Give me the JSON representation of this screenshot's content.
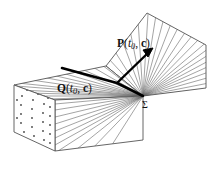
{
  "figure": {
    "type": "geometric-diagram",
    "background_color": "#ffffff",
    "line_color": "#555555",
    "bold_line_color": "#000000",
    "text_color": "#111111",
    "width": 219,
    "height": 173
  },
  "labels": {
    "vector_p": {
      "name": "P",
      "arg_time": "t",
      "arg_time_sub": "0",
      "comma": ", ",
      "arg_vec": "c",
      "open": "(",
      "close": ")",
      "full": "P(t0, c)"
    },
    "vector_q": {
      "name": "Q",
      "arg_time": "t",
      "arg_time_sub": "0",
      "comma": ", ",
      "arg_vec": "c",
      "open": "(",
      "close": ")",
      "full": "Q(t0, c)"
    },
    "surface_sigma": {
      "symbol": "Σ",
      "full": "Σ"
    }
  },
  "geometry": {
    "prism": {
      "left_face_corners": "14,85 14,132 55,151 55,100",
      "top_face_corners": "14,85 55,100 143,96 106,66",
      "front_face_corners": "55,100 55,151 143,140 143,96",
      "dot_fill": true,
      "dot_color": "#444444",
      "dot_count": 28
    },
    "fan_surface": {
      "corners": "106,66 147,13 206,45 206,88 143,96",
      "apex": "143,96",
      "hatch_count": 18
    },
    "bold_polyline": "62,68 117,83 143,96",
    "arrow": {
      "from": "117,83",
      "to": "152,49",
      "head_size": 7
    }
  }
}
